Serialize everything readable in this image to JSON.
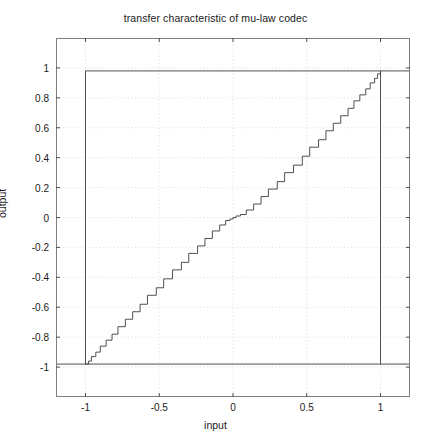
{
  "chart_data": {
    "type": "line",
    "title": "transfer characteristic of mu-law codec",
    "xlabel": "input",
    "ylabel": "output",
    "xlim": [
      -1.2,
      1.2
    ],
    "ylim": [
      -1.2,
      1.2
    ],
    "grid": true,
    "grid_style": "dotted",
    "legend": "none",
    "xticks": [
      -1,
      -0.5,
      0,
      0.5,
      1
    ],
    "xtick_labels": [
      "-1",
      "-0.5",
      "0",
      "0.5",
      "1"
    ],
    "yticks": [
      -1,
      -0.8,
      -0.6,
      -0.4,
      -0.2,
      0,
      0.2,
      0.4,
      0.6,
      0.8,
      1
    ],
    "ytick_labels": [
      "-1",
      "-0.8",
      "-0.6",
      "-0.4",
      "-0.2",
      "0",
      "0.2",
      "0.4",
      "0.6",
      "0.8",
      "1"
    ],
    "series": [
      {
        "name": "mu-law quantized transfer",
        "description": "staircase quantization, coarse steps near full scale, fine steps near zero",
        "mu": 255,
        "levels": 256,
        "x_range": [
          -1,
          1
        ],
        "points_x": [
          -1,
          -0.98,
          -0.96,
          -0.93,
          -0.9,
          -0.86,
          -0.82,
          -0.78,
          -0.73,
          -0.68,
          -0.63,
          -0.58,
          -0.52,
          -0.47,
          -0.41,
          -0.35,
          -0.3,
          -0.24,
          -0.19,
          -0.14,
          -0.09,
          -0.05,
          -0.02,
          0,
          0.02,
          0.05,
          0.09,
          0.14,
          0.19,
          0.24,
          0.3,
          0.35,
          0.41,
          0.47,
          0.52,
          0.58,
          0.63,
          0.68,
          0.73,
          0.78,
          0.82,
          0.86,
          0.9,
          0.93,
          0.96,
          0.98,
          1
        ],
        "points_y": [
          -0.98,
          -0.96,
          -0.93,
          -0.9,
          -0.86,
          -0.82,
          -0.78,
          -0.73,
          -0.68,
          -0.63,
          -0.58,
          -0.52,
          -0.47,
          -0.41,
          -0.35,
          -0.3,
          -0.24,
          -0.19,
          -0.14,
          -0.09,
          -0.05,
          -0.02,
          -0.01,
          0,
          0.01,
          0.02,
          0.05,
          0.09,
          0.14,
          0.19,
          0.24,
          0.3,
          0.35,
          0.41,
          0.47,
          0.52,
          0.58,
          0.63,
          0.68,
          0.73,
          0.78,
          0.82,
          0.86,
          0.9,
          0.93,
          0.96,
          0.98
        ]
      },
      {
        "name": "overflow wrap low",
        "description": "horizontal clipped branch at y = -0.98 for input below -1 and above +1",
        "y_value": -0.98
      },
      {
        "name": "overflow wrap high",
        "description": "horizontal clipped branch at y = +0.98 for input inside [-1, 1] drawn at top",
        "y_value": 0.98
      }
    ],
    "annotations": []
  }
}
